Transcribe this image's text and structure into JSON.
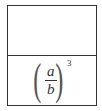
{
  "table": {
    "cells": [
      {
        "content": ""
      },
      {
        "content": {
          "numerator": "a",
          "denominator": "b",
          "exponent": "3",
          "left_paren": "(",
          "right_paren": ")"
        }
      }
    ]
  }
}
